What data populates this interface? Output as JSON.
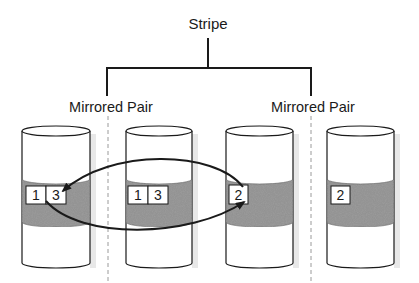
{
  "diagram": {
    "title": "Stripe",
    "groups": [
      {
        "label": "Mirrored Pair"
      },
      {
        "label": "Mirrored Pair"
      }
    ],
    "disks": [
      {
        "blocks": [
          "1",
          "3"
        ]
      },
      {
        "blocks": [
          "1",
          "3"
        ]
      },
      {
        "blocks": [
          "2"
        ]
      },
      {
        "blocks": [
          "2"
        ]
      }
    ],
    "arrows": [
      {
        "from": "disk-3 block 2",
        "to": "disk-1 block 3"
      },
      {
        "from": "disk-1 block 1",
        "to": "disk-3 block 2"
      }
    ],
    "colors": {
      "line": "#1a1a1a",
      "band": "#8f8f8f",
      "disk": "#ffffff",
      "shadow": "#e6e6e6",
      "divider": "#9a9a9a"
    }
  }
}
